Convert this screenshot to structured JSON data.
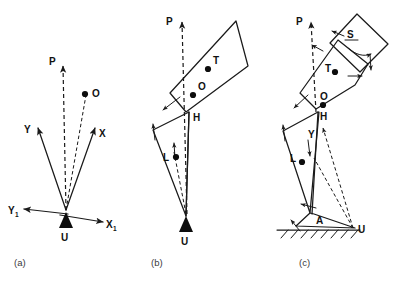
{
  "figure": {
    "background_color": "#ffffff",
    "line_color": "#1a1a1a",
    "panels": [
      {
        "id": "a",
        "caption": "(a)",
        "description": "Single rigid segment pivoting about support point U with body axes X, Y and ground axes X1, Y1",
        "labels": {
          "p": "P",
          "o": "O",
          "x": "X",
          "y": "Y",
          "x1": "X",
          "x1_sub": "1",
          "y1": "Y",
          "y1_sub": "1",
          "u": "U"
        }
      },
      {
        "id": "b",
        "caption": "(b)",
        "description": "Two-segment model: trunk rectangle with centres T and O hinged at H to thigh triangle with centre L, supported at U",
        "labels": {
          "p": "P",
          "t": "T",
          "o": "O",
          "h": "H",
          "l": "L",
          "u": "U"
        }
      },
      {
        "id": "c",
        "caption": "(c)",
        "description": "Multi-segment model: head square S, trunk with centres T and O, hip H, shank with centres L and Y, ankle A, foot on hatched ground, support point U",
        "labels": {
          "p": "P",
          "s": "S",
          "t": "T",
          "o": "O",
          "h": "H",
          "y": "Y",
          "l": "L",
          "a": "A",
          "u": "U"
        }
      }
    ]
  }
}
